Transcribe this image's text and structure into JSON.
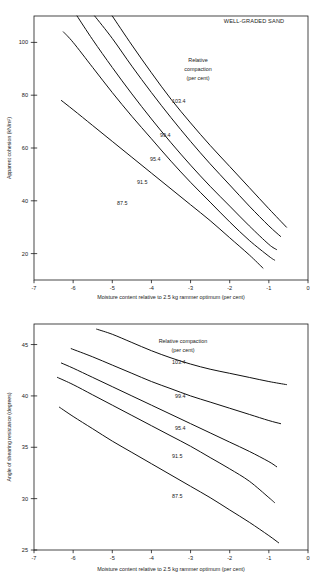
{
  "figure": {
    "name": "compaction-shear-strength-figure",
    "panel_count": 2
  },
  "chart_data": [
    {
      "type": "line",
      "id": "apparent-cohesion",
      "title": "",
      "annotation": "WELL-GRADED SAND",
      "xlabel": "Moisture content relative to 2.5 kg rammer optimum (per cent)",
      "ylabel": "Apparent cohesion (kN/m²)",
      "xlim": [
        -7,
        0
      ],
      "ylim": [
        10,
        110
      ],
      "xticks": [
        -7,
        -6,
        -5,
        -4,
        -3,
        -2,
        -1,
        0
      ],
      "xticklabels": [
        "-7",
        "-6",
        "-5",
        "-4",
        "-3",
        "-2",
        "-1",
        "0"
      ],
      "yticks": [
        20,
        40,
        60,
        80,
        100
      ],
      "yticklabels": [
        "20",
        "40",
        "60",
        "80",
        "100"
      ],
      "grid": false,
      "legend_title": "Relative compaction (per cent)",
      "legend_title_lines": [
        "Relative",
        "compaction",
        "(per cent)"
      ],
      "series": [
        {
          "name": "103.4",
          "label": "103.4",
          "x": [
            -5.0,
            -4.5,
            -4.0,
            -3.5,
            -3.0,
            -2.5,
            -2.0,
            -1.5,
            -1.0,
            -0.55
          ],
          "y": [
            110.0,
            99.0,
            88.5,
            78.5,
            69.5,
            61.0,
            53.0,
            45.0,
            37.0,
            30.0
          ]
        },
        {
          "name": "99.4",
          "label": "99.4",
          "x": [
            -5.45,
            -5.0,
            -4.5,
            -4.0,
            -3.5,
            -3.0,
            -2.5,
            -2.0,
            -1.5,
            -1.0,
            -0.7
          ],
          "y": [
            110.0,
            101.5,
            91.0,
            81.0,
            71.5,
            62.5,
            54.0,
            46.0,
            38.0,
            30.5,
            26.5
          ]
        },
        {
          "name": "95.4",
          "label": "95.4",
          "x": [
            -5.9,
            -5.5,
            -5.0,
            -4.5,
            -4.0,
            -3.5,
            -3.0,
            -2.5,
            -2.0,
            -1.5,
            -1.0,
            -0.8
          ],
          "y": [
            110.0,
            101.0,
            90.5,
            80.5,
            71.0,
            62.0,
            53.5,
            45.5,
            38.0,
            30.5,
            23.5,
            21.5
          ]
        },
        {
          "name": "91.5",
          "label": "91.5",
          "x": [
            -6.25,
            -6.0,
            -5.5,
            -5.0,
            -4.5,
            -4.0,
            -3.5,
            -3.0,
            -2.5,
            -2.0,
            -1.5,
            -1.0,
            -0.85
          ],
          "y": [
            104.0,
            100.0,
            90.5,
            81.0,
            72.0,
            63.5,
            55.0,
            47.0,
            39.5,
            32.0,
            25.0,
            19.0,
            17.5
          ]
        },
        {
          "name": "87.5",
          "label": "87.5",
          "x": [
            -6.3,
            -6.0,
            -5.5,
            -5.0,
            -4.5,
            -4.0,
            -3.5,
            -3.0,
            -2.5,
            -2.0,
            -1.5,
            -1.15
          ],
          "y": [
            78.0,
            74.5,
            68.5,
            62.5,
            56.5,
            50.5,
            44.5,
            38.5,
            32.5,
            26.0,
            19.5,
            14.5
          ]
        }
      ]
    },
    {
      "type": "line",
      "id": "angle-of-shearing-resistance",
      "title": "",
      "annotation": "",
      "xlabel": "Moisture content relative to 2.5 kg rammer optimum (per cent)",
      "ylabel": "Angle of shearing resistance (degrees)",
      "xlim": [
        -7,
        0
      ],
      "ylim": [
        25,
        47
      ],
      "xticks": [
        -7,
        -6,
        -5,
        -4,
        -3,
        -2,
        -1,
        0
      ],
      "xticklabels": [
        "-7",
        "-6",
        "-5",
        "-4",
        "-3",
        "-2",
        "-1",
        "0"
      ],
      "yticks": [
        25,
        30,
        35,
        40,
        45
      ],
      "yticklabels": [
        "25",
        "30",
        "35",
        "40",
        "45"
      ],
      "grid": false,
      "legend_title": "Relative compaction (per cent)",
      "legend_title_lines": [
        "Relative compaction",
        "(per cent)"
      ],
      "series": [
        {
          "name": "103.4",
          "label": "103.4",
          "x": [
            -5.4,
            -5.0,
            -4.5,
            -4.0,
            -3.5,
            -3.0,
            -2.5,
            -2.0,
            -1.5,
            -1.0,
            -0.55
          ],
          "y": [
            46.5,
            46.0,
            45.2,
            44.4,
            43.7,
            43.1,
            42.6,
            42.2,
            41.8,
            41.4,
            41.1
          ]
        },
        {
          "name": "99.4",
          "label": "99.4",
          "x": [
            -6.05,
            -5.5,
            -5.0,
            -4.5,
            -4.0,
            -3.5,
            -3.0,
            -2.5,
            -2.0,
            -1.5,
            -1.0,
            -0.7
          ],
          "y": [
            44.6,
            43.8,
            43.0,
            42.2,
            41.4,
            40.7,
            40.0,
            39.4,
            38.8,
            38.2,
            37.6,
            37.3
          ]
        },
        {
          "name": "95.4",
          "label": "95.4",
          "x": [
            -6.3,
            -6.0,
            -5.5,
            -5.0,
            -4.5,
            -4.0,
            -3.5,
            -3.0,
            -2.5,
            -2.0,
            -1.5,
            -1.0,
            -0.8
          ],
          "y": [
            43.2,
            42.7,
            41.8,
            40.9,
            40.0,
            39.1,
            38.2,
            37.3,
            36.4,
            35.5,
            34.6,
            33.6,
            33.1
          ]
        },
        {
          "name": "91.5",
          "label": "91.5",
          "x": [
            -6.4,
            -6.0,
            -5.5,
            -5.0,
            -4.5,
            -4.0,
            -3.5,
            -3.0,
            -2.5,
            -2.0,
            -1.5,
            -1.0,
            -0.85
          ],
          "y": [
            41.8,
            41.1,
            40.1,
            39.1,
            38.1,
            37.1,
            36.1,
            35.1,
            34.0,
            32.9,
            31.7,
            30.1,
            29.6
          ]
        },
        {
          "name": "87.5",
          "label": "87.5",
          "x": [
            -6.35,
            -6.0,
            -5.5,
            -5.0,
            -4.5,
            -4.0,
            -3.5,
            -3.0,
            -2.5,
            -2.0,
            -1.5,
            -1.0,
            -0.75
          ],
          "y": [
            38.9,
            38.0,
            36.8,
            35.6,
            34.5,
            33.4,
            32.3,
            31.2,
            30.1,
            28.9,
            27.7,
            26.4,
            25.7
          ]
        }
      ]
    }
  ]
}
